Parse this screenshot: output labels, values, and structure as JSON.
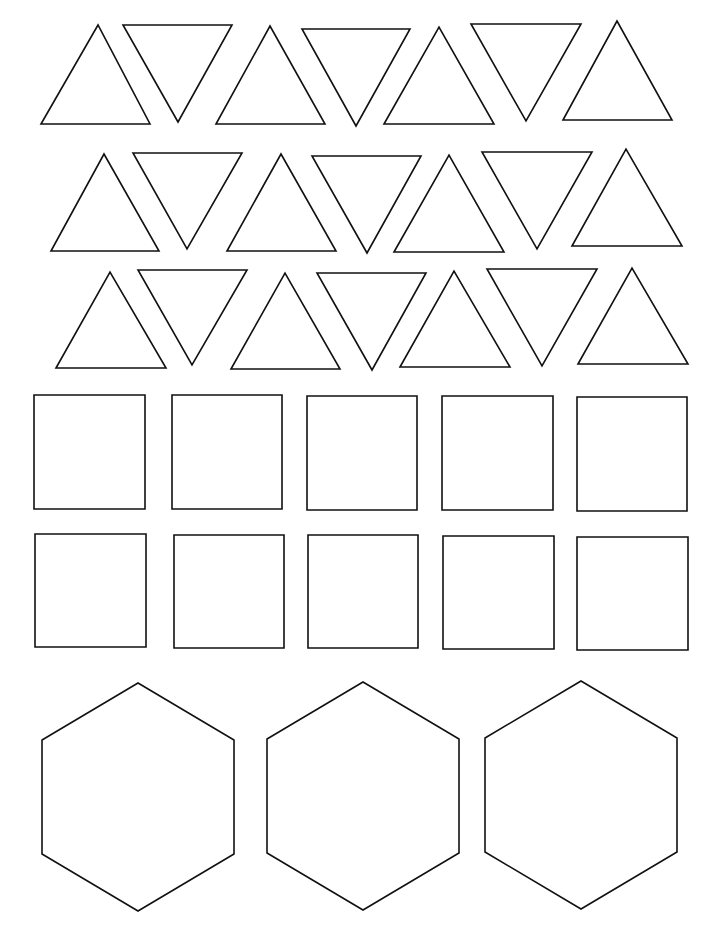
{
  "page": {
    "width": 719,
    "height": 937,
    "background": "#ffffff",
    "stroke_color": "#111111"
  },
  "triangles": [
    {
      "dir": "up",
      "points": [
        [
          41,
          124
        ],
        [
          98,
          25
        ],
        [
          150,
          124
        ]
      ]
    },
    {
      "dir": "down",
      "points": [
        [
          123,
          25
        ],
        [
          232,
          25
        ],
        [
          178,
          122
        ]
      ]
    },
    {
      "dir": "up",
      "points": [
        [
          216,
          124
        ],
        [
          270,
          26
        ],
        [
          325,
          124
        ]
      ]
    },
    {
      "dir": "down",
      "points": [
        [
          302,
          29
        ],
        [
          410,
          29
        ],
        [
          356,
          126
        ]
      ]
    },
    {
      "dir": "up",
      "points": [
        [
          384,
          124
        ],
        [
          439,
          27
        ],
        [
          494,
          124
        ]
      ]
    },
    {
      "dir": "down",
      "points": [
        [
          471,
          24
        ],
        [
          581,
          24
        ],
        [
          526,
          121
        ]
      ]
    },
    {
      "dir": "up",
      "points": [
        [
          563,
          120
        ],
        [
          617,
          21
        ],
        [
          672,
          120
        ]
      ]
    },
    {
      "dir": "up",
      "points": [
        [
          51,
          251
        ],
        [
          104,
          154
        ],
        [
          159,
          251
        ]
      ]
    },
    {
      "dir": "down",
      "points": [
        [
          133,
          153
        ],
        [
          242,
          153
        ],
        [
          187,
          249
        ]
      ]
    },
    {
      "dir": "up",
      "points": [
        [
          227,
          251
        ],
        [
          281,
          154
        ],
        [
          336,
          251
        ]
      ]
    },
    {
      "dir": "down",
      "points": [
        [
          312,
          156
        ],
        [
          421,
          156
        ],
        [
          367,
          253
        ]
      ]
    },
    {
      "dir": "up",
      "points": [
        [
          394,
          252
        ],
        [
          449,
          155
        ],
        [
          504,
          252
        ]
      ]
    },
    {
      "dir": "down",
      "points": [
        [
          482,
          152
        ],
        [
          592,
          152
        ],
        [
          537,
          249
        ]
      ]
    },
    {
      "dir": "up",
      "points": [
        [
          572,
          246
        ],
        [
          626,
          149
        ],
        [
          682,
          246
        ]
      ]
    },
    {
      "dir": "up",
      "points": [
        [
          56,
          368
        ],
        [
          110,
          272
        ],
        [
          166,
          368
        ]
      ]
    },
    {
      "dir": "down",
      "points": [
        [
          138,
          270
        ],
        [
          247,
          270
        ],
        [
          192,
          365
        ]
      ]
    },
    {
      "dir": "up",
      "points": [
        [
          231,
          369
        ],
        [
          285,
          273
        ],
        [
          340,
          369
        ]
      ]
    },
    {
      "dir": "down",
      "points": [
        [
          317,
          273
        ],
        [
          426,
          273
        ],
        [
          372,
          370
        ]
      ]
    },
    {
      "dir": "up",
      "points": [
        [
          400,
          367
        ],
        [
          454,
          271
        ],
        [
          510,
          367
        ]
      ]
    },
    {
      "dir": "down",
      "points": [
        [
          487,
          269
        ],
        [
          597,
          269
        ],
        [
          542,
          366
        ]
      ]
    },
    {
      "dir": "up",
      "points": [
        [
          578,
          364
        ],
        [
          632,
          268
        ],
        [
          688,
          364
        ]
      ]
    }
  ],
  "squares": [
    {
      "x": 34,
      "y": 395,
      "w": 111,
      "h": 114
    },
    {
      "x": 172,
      "y": 395,
      "w": 110,
      "h": 114
    },
    {
      "x": 307,
      "y": 396,
      "w": 110,
      "h": 114
    },
    {
      "x": 442,
      "y": 396,
      "w": 111,
      "h": 114
    },
    {
      "x": 577,
      "y": 397,
      "w": 110,
      "h": 114
    },
    {
      "x": 35,
      "y": 534,
      "w": 111,
      "h": 113
    },
    {
      "x": 174,
      "y": 535,
      "w": 110,
      "h": 113
    },
    {
      "x": 308,
      "y": 535,
      "w": 110,
      "h": 113
    },
    {
      "x": 443,
      "y": 536,
      "w": 111,
      "h": 113
    },
    {
      "x": 577,
      "y": 537,
      "w": 111,
      "h": 113
    }
  ],
  "hexagons": [
    {
      "cx": 138,
      "cy": 797,
      "rx": 96,
      "ry": 114
    },
    {
      "cx": 363,
      "cy": 796,
      "rx": 96,
      "ry": 114
    },
    {
      "cx": 581,
      "cy": 795,
      "rx": 96,
      "ry": 114
    }
  ]
}
